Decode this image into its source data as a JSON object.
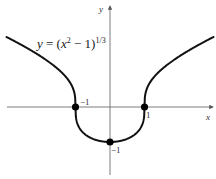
{
  "chart_data": {
    "type": "line",
    "title": "",
    "equation_label": "y = (x² − 1)^(1/3)",
    "equation_parts": {
      "lhs": "y = (",
      "var": "x",
      "sup1": "2",
      "mid": " − 1)",
      "sup2": "1/3"
    },
    "xlabel": "x",
    "ylabel": "y",
    "xlim": [
      -3,
      3
    ],
    "ylim": [
      -1.9,
      2.8
    ],
    "grid": false,
    "legend": null,
    "tick_labels": {
      "x": [
        {
          "value": -1,
          "label": "−1"
        },
        {
          "value": 1,
          "label": "1"
        }
      ],
      "y": [
        {
          "value": -1,
          "label": "−1"
        }
      ]
    },
    "series": [
      {
        "name": "y = (x^2 - 1)^(1/3)",
        "function": "cbrt(x^2 - 1)",
        "x": [
          -3,
          -2.5,
          -2,
          -1.5,
          -1.2,
          -1,
          -0.8,
          -0.5,
          0,
          0.5,
          0.8,
          1,
          1.2,
          1.5,
          2,
          2.5,
          3
        ],
        "y": [
          2.0,
          1.738,
          1.442,
          1.077,
          0.761,
          0,
          -0.711,
          -0.909,
          -1,
          -0.909,
          -0.711,
          0,
          0.761,
          1.077,
          1.442,
          1.738,
          2.0
        ]
      }
    ],
    "highlighted_points": [
      {
        "x": -1,
        "y": 0
      },
      {
        "x": 1,
        "y": 0
      },
      {
        "x": 0,
        "y": -1
      }
    ]
  },
  "style": {
    "curve_color": "#111111",
    "axis_color": "#6e6e6e",
    "point_color": "#000000"
  }
}
